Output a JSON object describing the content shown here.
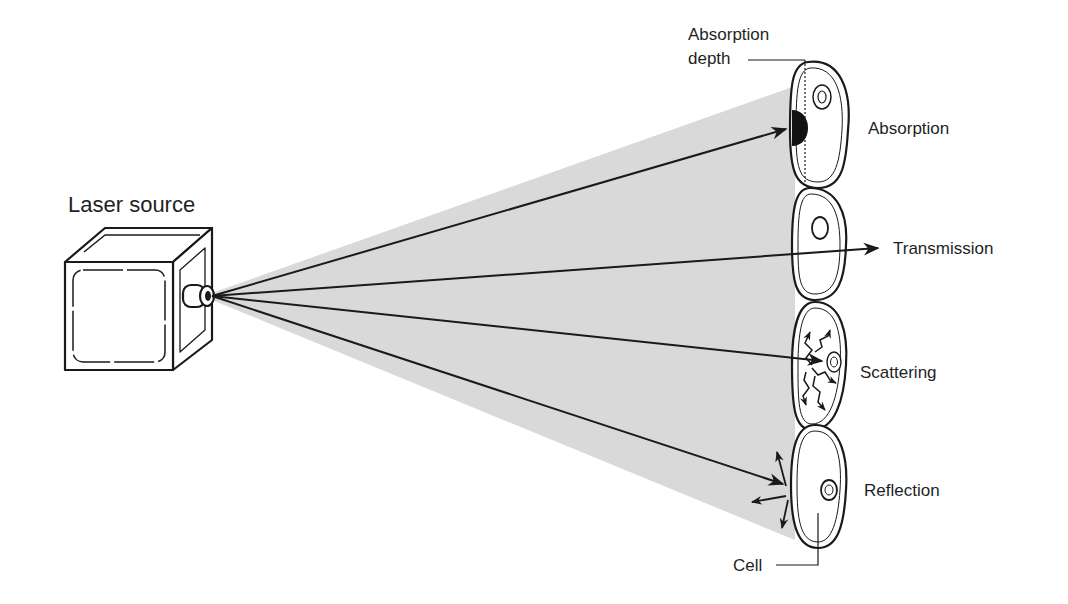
{
  "diagram": {
    "source_label": "Laser source",
    "absorption_depth_label_line1": "Absorption",
    "absorption_depth_label_line2": "depth",
    "interactions": [
      {
        "label": "Absorption"
      },
      {
        "label": "Transmission"
      },
      {
        "label": "Scattering"
      },
      {
        "label": "Reflection"
      }
    ],
    "cell_label": "Cell",
    "colors": {
      "beam": "#d9d9d9",
      "ink": "#1a1a1a",
      "background": "#ffffff"
    }
  }
}
